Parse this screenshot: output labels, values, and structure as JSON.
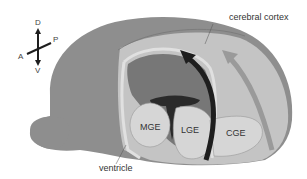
{
  "diagram": {
    "labels": {
      "cortex": "cerebral cortex",
      "mge": "MGE",
      "lge": "LGE",
      "cge": "CGE",
      "ventricle": "ventricle"
    },
    "orientation": {
      "dorsal": "D",
      "ventral": "V",
      "anterior": "A",
      "posterior": "P"
    },
    "colors": {
      "brain_outer": "#8e8e8e",
      "cortex_fill": "#c4c4c4",
      "eminence_fill": "#d6d6d6",
      "dark_arrow": "#1e1e1e",
      "light_arrow": "#9a9a9a",
      "background": "#ffffff"
    }
  }
}
